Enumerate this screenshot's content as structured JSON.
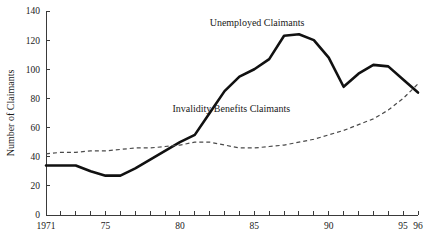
{
  "chart_data": {
    "type": "line",
    "title": "",
    "xlabel": "",
    "ylabel": "Number of Claimants",
    "xlim": [
      1971,
      1996
    ],
    "ylim": [
      0,
      140
    ],
    "grid": false,
    "legend_position": "inline-annotation",
    "y_ticks": [
      0,
      20,
      40,
      60,
      80,
      100,
      120,
      140
    ],
    "y_tick_labels": [
      "0",
      "20",
      "40",
      "60",
      "80",
      "100",
      "120",
      "140"
    ],
    "x_ticks": [
      1971,
      1972,
      1973,
      1974,
      1975,
      1976,
      1977,
      1978,
      1979,
      1980,
      1981,
      1982,
      1983,
      1984,
      1985,
      1986,
      1987,
      1988,
      1989,
      1990,
      1991,
      1992,
      1993,
      1994,
      1995,
      1996
    ],
    "x_tick_labels": [
      {
        "x": 1971,
        "label": "1971"
      },
      {
        "x": 1975,
        "label": "75"
      },
      {
        "x": 1980,
        "label": "80"
      },
      {
        "x": 1985,
        "label": "85"
      },
      {
        "x": 1990,
        "label": "90"
      },
      {
        "x": 1995,
        "label": "95"
      },
      {
        "x": 1996,
        "label": "96"
      }
    ],
    "x": [
      1971,
      1972,
      1973,
      1974,
      1975,
      1976,
      1977,
      1978,
      1979,
      1980,
      1981,
      1982,
      1983,
      1984,
      1985,
      1986,
      1987,
      1988,
      1989,
      1990,
      1991,
      1992,
      1993,
      1994,
      1995,
      1996
    ],
    "series": [
      {
        "name": "Unemployed Claimants",
        "style": "solid",
        "color": "#111111",
        "values": [
          34,
          34,
          34,
          30,
          27,
          27,
          32,
          38,
          44,
          50,
          55,
          70,
          85,
          95,
          100,
          107,
          123,
          124,
          120,
          108,
          88,
          97,
          103,
          102,
          93,
          84
        ]
      },
      {
        "name": "Invalidity Benefits Claimants",
        "style": "dashed",
        "color": "#4a4a4a",
        "values": [
          42,
          43,
          43,
          44,
          44,
          45,
          46,
          46,
          47,
          48,
          50,
          50,
          48,
          46,
          46,
          47,
          48,
          50,
          52,
          55,
          58,
          62,
          66,
          72,
          80,
          90
        ]
      }
    ],
    "annotations": [
      {
        "text": "Unemployed Claimants",
        "x": 1982.0,
        "y": 130,
        "anchor": "start"
      },
      {
        "text": "Invalidity Benefits Claimants",
        "x": 1979.5,
        "y": 71,
        "anchor": "start"
      }
    ]
  }
}
